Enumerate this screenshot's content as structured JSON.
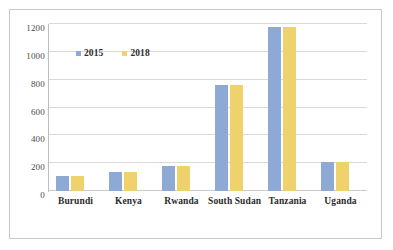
{
  "chart_data": {
    "type": "bar",
    "title": "",
    "xlabel": "",
    "ylabel": "",
    "categories": [
      "Burundi",
      "Kenya",
      "Rwanda",
      "South Sudan",
      "Tanzania",
      "Uganda"
    ],
    "series": [
      {
        "name": "2015",
        "color": "#8ea9d4",
        "values": [
          105,
          140,
          183,
          765,
          1175,
          210
        ]
      },
      {
        "name": "2018",
        "color": "#efd26b",
        "values": [
          105,
          140,
          183,
          765,
          1175,
          210
        ]
      }
    ],
    "ylim": [
      0,
      1200
    ],
    "ytick_labels": [
      "0",
      "200",
      "400",
      "600",
      "800",
      "1000",
      "1200"
    ],
    "ytick_values": [
      0,
      200,
      400,
      600,
      800,
      1000,
      1200
    ],
    "grid": true,
    "legend_position": "upper-left-inside"
  },
  "legend": {
    "entries": [
      {
        "label": "2015",
        "swatch": "legend-swatch-2015"
      },
      {
        "label": "2018",
        "swatch": "legend-swatch-2018"
      }
    ]
  }
}
